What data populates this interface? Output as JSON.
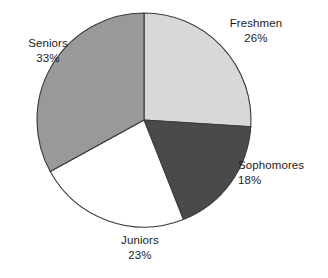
{
  "chart_data": {
    "type": "pie",
    "title": "",
    "categories": [
      "Freshmen",
      "Sophomores",
      "Juniors",
      "Seniors"
    ],
    "values": [
      26,
      18,
      23,
      33
    ],
    "unit": "%",
    "legend": "none",
    "labels_position": "outside",
    "start_angle_deg": 0,
    "direction": "clockwise",
    "slices": [
      {
        "label": "Freshmen",
        "value": 26,
        "value_text": "26%",
        "color": "#d8d8d8"
      },
      {
        "label": "Sophomores",
        "value": 18,
        "value_text": "18%",
        "color": "#4a4a4a"
      },
      {
        "label": "Juniors",
        "value": 23,
        "value_text": "23%",
        "color": "#ffffff"
      },
      {
        "label": "Seniors",
        "value": 33,
        "value_text": "33%",
        "color": "#999999"
      }
    ],
    "geometry": {
      "cx": 144,
      "cy": 120,
      "r": 107
    },
    "outline_color": "#3a3a3a",
    "background": "#ffffff"
  }
}
